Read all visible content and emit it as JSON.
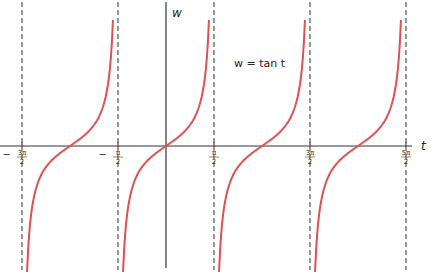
{
  "chart_data": {
    "type": "line",
    "title": "",
    "function_label": "w = tan t",
    "xlabel": "t",
    "ylabel": "w",
    "x_ticks": [
      {
        "value": -4.71239,
        "num": "3π",
        "den": "2",
        "sign": "−"
      },
      {
        "value": -1.5708,
        "num": "π",
        "den": "2",
        "sign": "−"
      },
      {
        "value": 1.5708,
        "num": "π",
        "den": "2",
        "sign": ""
      },
      {
        "value": 4.71239,
        "num": "3π",
        "den": "2",
        "sign": ""
      },
      {
        "value": 7.85398,
        "num": "5π",
        "den": "2",
        "sign": ""
      }
    ],
    "asymptotes": [
      -4.71239,
      -1.5708,
      1.5708,
      4.71239,
      7.85398
    ],
    "series": [
      {
        "name": "tan t",
        "branches": [
          [
            -4.71239,
            -1.5708
          ],
          [
            -1.5708,
            1.5708
          ],
          [
            1.5708,
            4.71239
          ],
          [
            4.71239,
            7.85398
          ]
        ]
      }
    ],
    "xlim": [
      -5.1,
      8.4
    ],
    "ylim": [
      -4,
      4
    ],
    "grid": false,
    "legend": "none",
    "colors": {
      "curve": "#e05050",
      "axis": "#333333",
      "asymptote": "#555555"
    }
  }
}
